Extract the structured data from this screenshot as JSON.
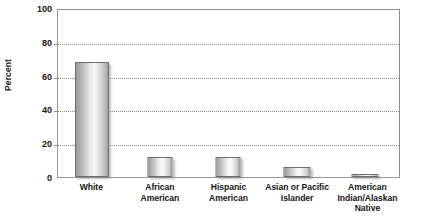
{
  "chart_data": {
    "type": "bar",
    "title": "",
    "xlabel": "",
    "ylabel": "Percent",
    "ylim": [
      0,
      100
    ],
    "yticks": [
      0,
      20,
      40,
      60,
      80,
      100
    ],
    "grid": true,
    "legend": false,
    "categories": [
      "White",
      "African American",
      "Hispanic American",
      "Asian or Pacific Islander",
      "American Indian/Alaskan Native"
    ],
    "category_lines": [
      [
        "White"
      ],
      [
        "African",
        "American"
      ],
      [
        "Hispanic",
        "American"
      ],
      [
        "Asian or Pacific",
        "Islander"
      ],
      [
        "American",
        "Indian/Alaskan",
        "Native"
      ]
    ],
    "values": [
      68,
      12,
      12,
      6,
      1
    ],
    "series": [
      {
        "name": "Percent",
        "values": [
          68,
          12,
          12,
          6,
          1
        ]
      }
    ]
  },
  "axis": {
    "y_title": "Percent",
    "tick_labels": [
      "100",
      "80",
      "60",
      "40",
      "20",
      "0"
    ]
  },
  "colors": {
    "bar_border": "#6e6e6e",
    "bar_fill_light": "#f6f6f6",
    "bar_fill_dark": "#9e9e9e",
    "gridline": "#8f8f8f",
    "axis_line": "#8d8d8d",
    "text": "#161616",
    "background": "#ffffff"
  }
}
